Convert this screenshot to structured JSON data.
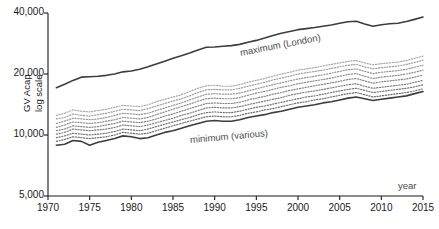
{
  "chart_data": {
    "type": "line",
    "title": "",
    "xlabel": "year",
    "ylabel": "GV Acap\nlog scale",
    "ylabel_line1": "GV Acap",
    "ylabel_line2": "log scale",
    "yscale": "log",
    "ylim": [
      5000,
      40000
    ],
    "xlim": [
      1970,
      2015
    ],
    "grid": false,
    "legend": "none",
    "ytick_labels": [
      "40,000",
      "20,000",
      "10,000",
      "5,000"
    ],
    "ytick_values": [
      40000,
      20000,
      10000,
      5000
    ],
    "xtick_labels": [
      "1970",
      "1975",
      "1980",
      "1985",
      "1990",
      "1995",
      "2000",
      "2005",
      "2010",
      "2015"
    ],
    "xtick_values": [
      1970,
      1975,
      1980,
      1985,
      1990,
      1995,
      2000,
      2005,
      2010,
      2015
    ],
    "annotations": [
      {
        "text": "maximum (London)",
        "x": 1993,
        "y": 25500,
        "rotation": -11
      },
      {
        "text": "minimum (various)",
        "x": 1987,
        "y": 9450,
        "rotation": -5
      },
      {
        "text": "year",
        "x": 2012,
        "y": 5600,
        "rotation": 0
      }
    ],
    "x": [
      1971,
      1972,
      1973,
      1974,
      1975,
      1976,
      1977,
      1978,
      1979,
      1980,
      1981,
      1982,
      1983,
      1984,
      1985,
      1986,
      1987,
      1988,
      1989,
      1990,
      1991,
      1992,
      1993,
      1994,
      1995,
      1996,
      1997,
      1998,
      1999,
      2000,
      2001,
      2002,
      2003,
      2004,
      2005,
      2006,
      2007,
      2008,
      2009,
      2010,
      2011,
      2012,
      2013,
      2014,
      2015
    ],
    "series": [
      {
        "name": "maximum (London)",
        "style": "solid",
        "color": "#3d3d3d",
        "width": 1.6,
        "values": [
          17100,
          17800,
          18600,
          19300,
          19400,
          19500,
          19700,
          20000,
          20500,
          20700,
          21100,
          21700,
          22400,
          23100,
          23900,
          24600,
          25400,
          26300,
          27100,
          27200,
          27400,
          27600,
          28000,
          28700,
          29300,
          30100,
          31000,
          31800,
          32400,
          33100,
          33500,
          33900,
          34400,
          34900,
          35600,
          36200,
          36400,
          35300,
          34400,
          35000,
          35400,
          35600,
          36300,
          37200,
          38200
        ]
      },
      {
        "name": "region-2",
        "style": "dotted",
        "color": "#a8a8a8",
        "width": 1.2,
        "values": [
          12500,
          12800,
          13300,
          13100,
          13000,
          13200,
          13400,
          13700,
          14000,
          13900,
          13800,
          14100,
          14600,
          15000,
          15400,
          15800,
          16400,
          17000,
          17500,
          17600,
          17400,
          17400,
          17700,
          18200,
          18600,
          19000,
          19500,
          20000,
          20400,
          20900,
          21200,
          21500,
          21900,
          22300,
          22700,
          23100,
          23300,
          22700,
          22200,
          22500,
          22700,
          22900,
          23300,
          23900,
          24500
        ]
      },
      {
        "name": "region-3",
        "style": "dotted",
        "color": "#9e9e9e",
        "width": 1.2,
        "values": [
          12000,
          12200,
          12700,
          12500,
          12400,
          12600,
          12800,
          13100,
          13400,
          13300,
          13200,
          13500,
          13900,
          14300,
          14700,
          15100,
          15600,
          16200,
          16700,
          16800,
          16700,
          16700,
          17000,
          17400,
          17800,
          18200,
          18700,
          19100,
          19500,
          20000,
          20300,
          20600,
          20900,
          21300,
          21700,
          22100,
          22300,
          21700,
          21200,
          21500,
          21700,
          21900,
          22300,
          22800,
          23400
        ]
      },
      {
        "name": "region-4",
        "style": "dotted",
        "color": "#959595",
        "width": 1.2,
        "values": [
          11400,
          11700,
          12100,
          12000,
          11900,
          12000,
          12200,
          12500,
          12800,
          12700,
          12600,
          12800,
          13200,
          13600,
          14000,
          14400,
          14900,
          15400,
          15900,
          16000,
          15900,
          15900,
          16100,
          16500,
          16900,
          17300,
          17700,
          18100,
          18500,
          18900,
          19200,
          19500,
          19800,
          20200,
          20600,
          21000,
          21200,
          20600,
          20100,
          20400,
          20600,
          20800,
          21100,
          21600,
          22100
        ]
      },
      {
        "name": "region-5",
        "style": "dotted",
        "color": "#8d8d8d",
        "width": 1.2,
        "values": [
          10900,
          11200,
          11600,
          11500,
          11400,
          11500,
          11700,
          11900,
          12200,
          12100,
          12000,
          12200,
          12600,
          13000,
          13400,
          13800,
          14200,
          14700,
          15100,
          15200,
          15100,
          15100,
          15300,
          15700,
          16100,
          16400,
          16800,
          17200,
          17500,
          17900,
          18200,
          18500,
          18800,
          19100,
          19500,
          19900,
          20100,
          19500,
          19000,
          19300,
          19500,
          19700,
          20000,
          20400,
          20900
        ]
      },
      {
        "name": "region-6",
        "style": "dotted",
        "color": "#858585",
        "width": 1.2,
        "values": [
          10500,
          10700,
          11100,
          11000,
          10900,
          11000,
          11200,
          11400,
          11700,
          11600,
          11500,
          11700,
          12000,
          12400,
          12700,
          13100,
          13500,
          13900,
          14300,
          14400,
          14300,
          14300,
          14500,
          14900,
          15200,
          15500,
          15900,
          16200,
          16600,
          16900,
          17200,
          17500,
          17800,
          18100,
          18400,
          18800,
          19000,
          18500,
          18000,
          18300,
          18500,
          18700,
          18900,
          19300,
          19800
        ]
      },
      {
        "name": "region-7",
        "style": "dotted",
        "color": "#7d7d7d",
        "width": 1.2,
        "values": [
          10100,
          10300,
          10700,
          10600,
          10500,
          10600,
          10700,
          10900,
          11200,
          11100,
          11000,
          11200,
          11500,
          11800,
          12100,
          12500,
          12800,
          13200,
          13600,
          13700,
          13600,
          13600,
          13800,
          14100,
          14400,
          14700,
          15000,
          15300,
          15700,
          16000,
          16300,
          16500,
          16800,
          17100,
          17400,
          17700,
          17900,
          17400,
          17000,
          17200,
          17400,
          17600,
          17800,
          18200,
          18600
        ]
      },
      {
        "name": "region-8",
        "style": "dotted",
        "color": "#757575",
        "width": 1.2,
        "values": [
          9700,
          9900,
          10200,
          10100,
          10000,
          10100,
          10200,
          10400,
          10700,
          10600,
          10500,
          10700,
          11000,
          11300,
          11600,
          11900,
          12200,
          12600,
          12900,
          13000,
          12900,
          12900,
          13100,
          13400,
          13700,
          13900,
          14200,
          14500,
          14800,
          15100,
          15400,
          15600,
          15900,
          16200,
          16500,
          16800,
          17000,
          16600,
          16200,
          16400,
          16600,
          16800,
          17000,
          17300,
          17700
        ]
      },
      {
        "name": "region-9",
        "style": "dotted",
        "color": "#6e6e6e",
        "width": 1.2,
        "values": [
          9300,
          9500,
          9800,
          9700,
          9600,
          9700,
          9800,
          10000,
          10300,
          10200,
          10100,
          10200,
          10500,
          10800,
          11100,
          11400,
          11700,
          12000,
          12300,
          12400,
          12300,
          12300,
          12500,
          12800,
          13000,
          13300,
          13500,
          13800,
          14100,
          14400,
          14600,
          14900,
          15100,
          15400,
          15700,
          16000,
          16200,
          15800,
          15400,
          15600,
          15800,
          16000,
          16200,
          16500,
          16900
        ]
      },
      {
        "name": "minimum (various)",
        "style": "solid",
        "color": "#3d3d3d",
        "width": 1.6,
        "values": [
          8900,
          9000,
          9400,
          9300,
          8900,
          9200,
          9400,
          9600,
          9900,
          9800,
          9600,
          9700,
          10000,
          10300,
          10500,
          10800,
          11100,
          11400,
          11700,
          11800,
          11700,
          11700,
          11900,
          12200,
          12400,
          12600,
          12900,
          13100,
          13400,
          13700,
          13900,
          14100,
          14400,
          14600,
          14900,
          15200,
          15400,
          15100,
          14800,
          15000,
          15200,
          15400,
          15600,
          16000,
          16400
        ]
      }
    ]
  }
}
